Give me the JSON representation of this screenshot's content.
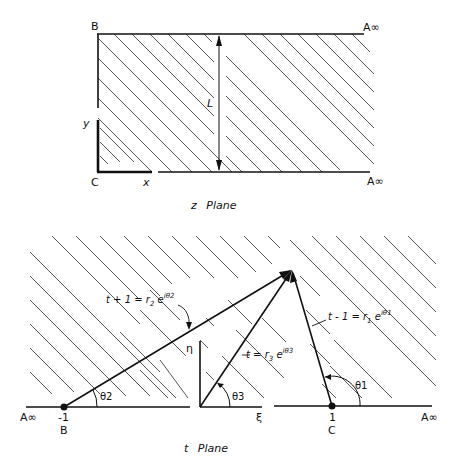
{
  "z_plane": {
    "caption": "z Plane",
    "labels": {
      "B": "B",
      "C": "C",
      "A_inf_top": "A∞",
      "A_inf_bottom": "A∞",
      "y_axis": "y",
      "x_axis": "x",
      "width": "L"
    }
  },
  "t_plane": {
    "caption": "t Plane",
    "labels": {
      "A_inf_left": "A∞",
      "A_inf_right": "A∞",
      "B_value": "-1",
      "B": "B",
      "C_value": "1",
      "C": "C",
      "eta_axis": "η",
      "xi_axis": "ξ",
      "theta1": "θ1",
      "theta2": "θ2",
      "theta3": "θ3"
    },
    "equations": {
      "eq1": "t - 1 = r1 e^(iθ1)",
      "eq2": "t + 1 = r2 e^(iθ2)",
      "eq3": "t = r3 e^(iθ3)"
    }
  },
  "colors": {
    "line": "#111111",
    "hatch": "#444444",
    "background": "#ffffff"
  }
}
